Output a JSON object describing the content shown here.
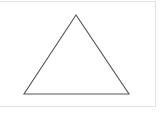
{
  "diagram": {
    "shape": "triangle",
    "type": "isosceles",
    "vertices": [
      {
        "x": 76,
        "y": 15
      },
      {
        "x": 24,
        "y": 94
      },
      {
        "x": 129,
        "y": 94
      }
    ],
    "stroke_color": "#555555",
    "fill_color": "none",
    "frame_color": "#e2e2e2",
    "background_color": "#ffffff"
  }
}
